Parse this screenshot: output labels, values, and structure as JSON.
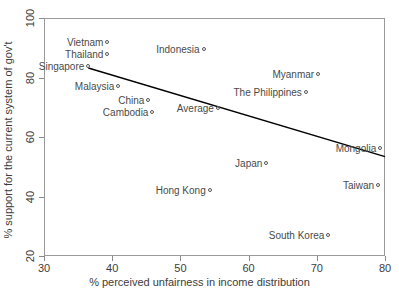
{
  "chart_data": {
    "type": "scatter",
    "title": "",
    "xlabel": "% perceived unfairness in income distribution",
    "ylabel": "% support for the current system of gov't",
    "xlim": [
      30,
      80
    ],
    "ylim": [
      20,
      100
    ],
    "xticks": [
      30,
      40,
      50,
      60,
      70,
      80
    ],
    "yticks": [
      20,
      40,
      60,
      80,
      100
    ],
    "grid": false,
    "legend": "none",
    "point_labels_position": "left-of-marker",
    "points": [
      {
        "label": "Vietnam",
        "x": 39.3,
        "y": 92.0
      },
      {
        "label": "Thailand",
        "x": 39.3,
        "y": 88.0
      },
      {
        "label": "Singapore",
        "x": 36.5,
        "y": 83.8
      },
      {
        "label": "Indonesia",
        "x": 53.4,
        "y": 89.6
      },
      {
        "label": "Malaysia",
        "x": 40.9,
        "y": 77.3
      },
      {
        "label": "China",
        "x": 45.3,
        "y": 72.4
      },
      {
        "label": "Cambodia",
        "x": 45.9,
        "y": 68.3
      },
      {
        "label": "Average",
        "x": 55.5,
        "y": 69.7
      },
      {
        "label": "Myanmar",
        "x": 70.2,
        "y": 81.3
      },
      {
        "label": "The Philippines",
        "x": 68.4,
        "y": 75.2
      },
      {
        "label": "Mongolia",
        "x": 79.3,
        "y": 56.3
      },
      {
        "label": "Japan",
        "x": 62.6,
        "y": 51.3
      },
      {
        "label": "Hong Kong",
        "x": 54.3,
        "y": 42.2
      },
      {
        "label": "Taiwan",
        "x": 79.0,
        "y": 43.7
      },
      {
        "label": "South Korea",
        "x": 71.7,
        "y": 27.2
      }
    ],
    "trendline": {
      "type": "linear-fit",
      "x_start": 36.5,
      "y_start": 83.2,
      "x_end": 80.0,
      "y_end": 53.4,
      "color": "#000000"
    }
  },
  "axis_colors": {
    "frame": "#9a9a9a",
    "tick": "#8a8a8a",
    "text": "#3c3c3c",
    "marker": "#555555",
    "label": "#4a4a4a"
  }
}
